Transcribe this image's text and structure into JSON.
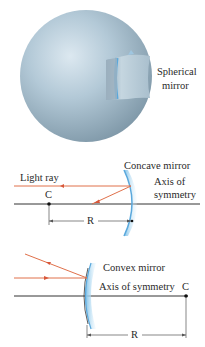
{
  "figure": {
    "panel_top": {
      "label_line1": "Spherical",
      "label_line2": "mirror"
    },
    "panel_concave": {
      "mirror_label": "Concave mirror",
      "ray_label": "Light ray",
      "axis_label_line1": "Axis of",
      "axis_label_line2": "symmetry",
      "center_label": "C",
      "radius_label": "R"
    },
    "panel_convex": {
      "mirror_label": "Convex mirror",
      "axis_label": "Axis of symmetry",
      "center_label": "C",
      "radius_label": "R"
    },
    "colors": {
      "ray": "#e0704a",
      "axis": "#333333",
      "mirror_blue": "#a9d4ee",
      "sphere": "#9fb8c8"
    }
  }
}
